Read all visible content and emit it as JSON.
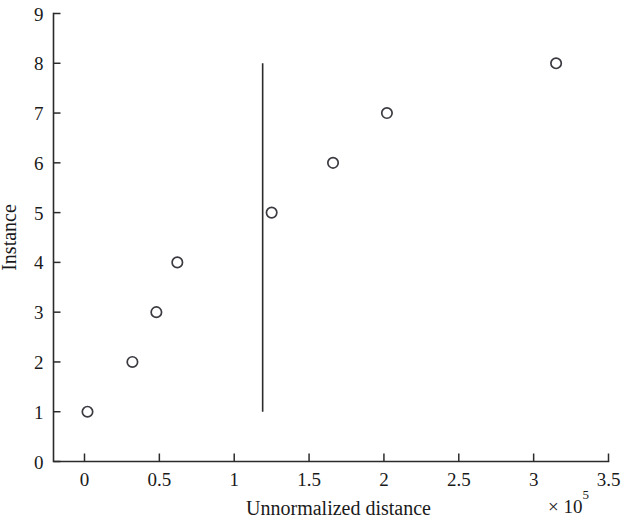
{
  "chart_data": {
    "type": "scatter",
    "title": "",
    "xlabel": "Unnormalized distance",
    "ylabel": "Instance",
    "x_multiplier": "× 10",
    "x_multiplier_exponent": "5",
    "xlim": [
      0,
      3.5
    ],
    "ylim": [
      0,
      9
    ],
    "x_ticks": [
      0,
      0.5,
      1,
      1.5,
      2,
      2.5,
      3,
      3.5
    ],
    "x_tick_labels": [
      "0",
      "0.5",
      "1",
      "1.5",
      "2",
      "2.5",
      "3",
      "3.5"
    ],
    "y_ticks": [
      0,
      1,
      2,
      3,
      4,
      5,
      6,
      7,
      8,
      9
    ],
    "y_tick_labels": [
      "0",
      "1",
      "2",
      "3",
      "4",
      "5",
      "6",
      "7",
      "8",
      "9"
    ],
    "grid": false,
    "legend": null,
    "marker": "open-circle",
    "marker_color": "#3a3a40",
    "axis_color": "#2b2b2b",
    "background_color": "#ffffff",
    "x": [
      0.02,
      0.32,
      0.48,
      0.62,
      1.25,
      1.66,
      2.02,
      3.15
    ],
    "y": [
      1,
      2,
      3,
      4,
      5,
      6,
      7,
      8
    ],
    "points": [
      {
        "x": 0.02,
        "y": 1
      },
      {
        "x": 0.32,
        "y": 2
      },
      {
        "x": 0.48,
        "y": 3
      },
      {
        "x": 0.62,
        "y": 4
      },
      {
        "x": 1.25,
        "y": 5
      },
      {
        "x": 1.66,
        "y": 6
      },
      {
        "x": 2.02,
        "y": 7
      },
      {
        "x": 3.15,
        "y": 8
      }
    ],
    "annotations": [
      {
        "type": "vertical-line",
        "x": 1.19,
        "y_start": 1,
        "y_end": 8,
        "color": "#2b2b2b"
      }
    ]
  }
}
